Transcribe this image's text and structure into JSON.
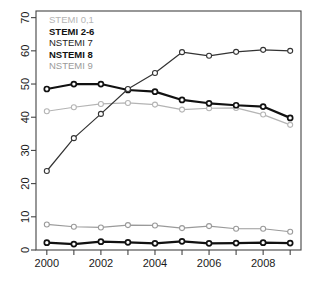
{
  "chart_data": {
    "type": "line",
    "title": "",
    "subtitle": "",
    "xlabel": "",
    "ylabel": "",
    "x": [
      2000,
      2001,
      2002,
      2003,
      2004,
      2005,
      2006,
      2007,
      2008,
      2009
    ],
    "xlim": [
      1999.6,
      2009.4
    ],
    "ylim": [
      0,
      72
    ],
    "xticks_major": [
      2000,
      2002,
      2004,
      2006,
      2008
    ],
    "xticks_minor": [
      2001,
      2003,
      2005,
      2007,
      2009
    ],
    "xtick_labels": [
      "2000",
      "2002",
      "2004",
      "2006",
      "2008"
    ],
    "yticks": [
      0,
      10,
      20,
      30,
      40,
      50,
      60,
      70
    ],
    "ytick_labels": [
      "0",
      "10",
      "20",
      "30",
      "40",
      "50",
      "60",
      "70"
    ],
    "ytick_label_rotation": -90,
    "grid": false,
    "legend_position": "top-left",
    "marker": "open-circle",
    "series": [
      {
        "name": "STEMI 0,1",
        "color": "#b4b4b4",
        "line_width": 1.2,
        "font_weight": "normal",
        "values": [
          41.8,
          43.0,
          44.0,
          44.3,
          43.8,
          42.3,
          42.7,
          42.8,
          40.8,
          37.7
        ]
      },
      {
        "name": "STEMI 2-6",
        "color": "#111111",
        "line_width": 2.2,
        "font_weight": "bold",
        "values": [
          48.5,
          50.0,
          50.0,
          48.2,
          47.7,
          45.2,
          44.2,
          43.6,
          43.2,
          39.8
        ]
      },
      {
        "name": "NSTEMI 7",
        "color": "#333333",
        "line_width": 1.2,
        "font_weight": "normal",
        "values": [
          23.8,
          33.7,
          41.0,
          48.5,
          53.3,
          59.6,
          58.5,
          59.7,
          60.3,
          60.0
        ]
      },
      {
        "name": "NSTEMI 8",
        "color": "#111111",
        "line_width": 2.2,
        "font_weight": "bold",
        "values": [
          2.2,
          1.8,
          2.5,
          2.3,
          2.0,
          2.6,
          2.0,
          2.1,
          2.2,
          2.1
        ]
      },
      {
        "name": "NSTEMI 9",
        "color": "#9a9a9a",
        "line_width": 1.2,
        "font_weight": "normal",
        "values": [
          7.7,
          7.0,
          6.8,
          7.5,
          7.4,
          6.6,
          7.2,
          6.4,
          6.4,
          5.5
        ]
      }
    ]
  },
  "legend": {
    "items": [
      {
        "label": "STEMI 0,1",
        "style": "legend-light"
      },
      {
        "label": "STEMI 2-6",
        "style": "legend-bold"
      },
      {
        "label": "NSTEMI 7",
        "style": "legend-mid"
      },
      {
        "label": "NSTEMI 8",
        "style": "legend-bold"
      },
      {
        "label": "NSTEMI 9",
        "style": "legend-gray"
      }
    ]
  },
  "colors": {
    "axis": "#444444",
    "background": "#ffffff",
    "stemi_01": "#b4b4b4",
    "stemi_26": "#111111",
    "nstemi_7": "#333333",
    "nstemi_8": "#111111",
    "nstemi_9": "#9a9a9a"
  }
}
